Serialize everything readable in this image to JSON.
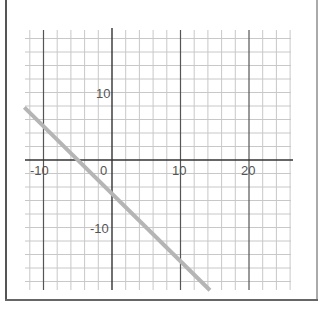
{
  "chart_data": {
    "type": "line",
    "title": "",
    "xlabel": "",
    "ylabel": "",
    "xlim": [
      -12.8,
      26
    ],
    "ylim": [
      -19.3,
      19
    ],
    "grid": true,
    "minor_grid_step": 2,
    "major_grid_step": 10,
    "x_tick_labels": [
      "-10",
      "0",
      "10",
      "20"
    ],
    "x_ticks": [
      -10,
      0,
      10,
      20
    ],
    "y_tick_labels": [
      "10",
      "-10"
    ],
    "y_ticks": [
      10,
      -10
    ],
    "series": [
      {
        "name": "y = -x - 5",
        "color": "#b5b5b5",
        "x": [
          -12.8,
          14.3
        ],
        "y": [
          7.8,
          -19.3
        ]
      }
    ],
    "legend": null
  },
  "colors": {
    "grid_minor": "#c8c8c8",
    "grid_major": "#555555",
    "axis": "#333333",
    "line": "#b5b5b5"
  }
}
